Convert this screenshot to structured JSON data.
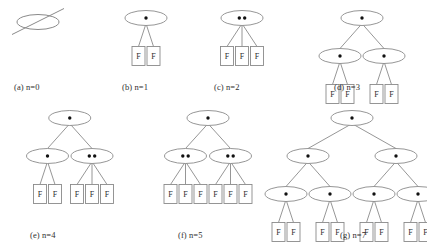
{
  "figure": {
    "background_color": "#ffffff",
    "stroke_color": "#8a8a8a",
    "dot_color": "#111111",
    "text_color": "#2c2c2c",
    "leaf_label": "F",
    "bottom_caption": "",
    "panels": [
      {
        "id": "panel-a",
        "caption": "(a) n=0",
        "x": 6,
        "y": 4,
        "width": 96,
        "height": 92,
        "caption_x": 14,
        "caption_y": 82,
        "empty_set": true,
        "root": null
      },
      {
        "id": "panel-b",
        "caption": "(b) n=1",
        "x": 104,
        "y": 4,
        "width": 84,
        "height": 92,
        "caption_x": 122,
        "caption_y": 82,
        "empty_set": false,
        "root": {
          "keys": 1,
          "children": [
            {
              "leaf": true,
              "label": "F"
            },
            {
              "leaf": true,
              "label": "F"
            }
          ]
        }
      },
      {
        "id": "panel-c",
        "caption": "(c) n=2",
        "x": 196,
        "y": 4,
        "width": 92,
        "height": 92,
        "caption_x": 214,
        "caption_y": 82,
        "empty_set": false,
        "root": {
          "keys": 2,
          "children": [
            {
              "leaf": true,
              "label": "F"
            },
            {
              "leaf": true,
              "label": "F"
            },
            {
              "leaf": true,
              "label": "F"
            }
          ]
        }
      },
      {
        "id": "panel-d",
        "caption": "(d) n=3",
        "x": 300,
        "y": 4,
        "width": 124,
        "height": 92,
        "caption_x": 334,
        "caption_y": 82,
        "empty_set": false,
        "root": {
          "keys": 1,
          "children": [
            {
              "keys": 1,
              "children": [
                {
                  "leaf": true,
                  "label": "F"
                },
                {
                  "leaf": true,
                  "label": "F"
                }
              ]
            },
            {
              "keys": 1,
              "children": [
                {
                  "leaf": true,
                  "label": "F"
                },
                {
                  "leaf": true,
                  "label": "F"
                }
              ]
            }
          ]
        }
      },
      {
        "id": "panel-e",
        "caption": "(e) n=4",
        "x": 8,
        "y": 104,
        "width": 124,
        "height": 118,
        "caption_x": 30,
        "caption_y": 230,
        "empty_set": false,
        "root": {
          "keys": 1,
          "children": [
            {
              "keys": 1,
              "children": [
                {
                  "leaf": true,
                  "label": "F"
                },
                {
                  "leaf": true,
                  "label": "F"
                }
              ]
            },
            {
              "keys": 2,
              "children": [
                {
                  "leaf": true,
                  "label": "F"
                },
                {
                  "leaf": true,
                  "label": "F"
                },
                {
                  "leaf": true,
                  "label": "F"
                }
              ]
            }
          ]
        }
      },
      {
        "id": "panel-f",
        "caption": "(f) n=5",
        "x": 146,
        "y": 104,
        "width": 124,
        "height": 118,
        "caption_x": 178,
        "caption_y": 230,
        "empty_set": false,
        "root": {
          "keys": 1,
          "children": [
            {
              "keys": 2,
              "children": [
                {
                  "leaf": true,
                  "label": "F"
                },
                {
                  "leaf": true,
                  "label": "F"
                },
                {
                  "leaf": true,
                  "label": "F"
                }
              ]
            },
            {
              "keys": 2,
              "children": [
                {
                  "leaf": true,
                  "label": "F"
                },
                {
                  "leaf": true,
                  "label": "F"
                },
                {
                  "leaf": true,
                  "label": "F"
                }
              ]
            }
          ]
        }
      },
      {
        "id": "panel-g",
        "caption": "(g) n=7",
        "x": 278,
        "y": 104,
        "width": 148,
        "height": 118,
        "caption_x": 340,
        "caption_y": 230,
        "empty_set": false,
        "root": {
          "keys": 1,
          "children": [
            {
              "keys": 1,
              "children": [
                {
                  "keys": 1,
                  "children": [
                    {
                      "leaf": true,
                      "label": "F"
                    },
                    {
                      "leaf": true,
                      "label": "F"
                    }
                  ]
                },
                {
                  "keys": 1,
                  "children": [
                    {
                      "leaf": true,
                      "label": "F"
                    },
                    {
                      "leaf": true,
                      "label": "F"
                    }
                  ]
                }
              ]
            },
            {
              "keys": 1,
              "children": [
                {
                  "keys": 1,
                  "children": [
                    {
                      "leaf": true,
                      "label": "F"
                    },
                    {
                      "leaf": true,
                      "label": "F"
                    }
                  ]
                },
                {
                  "keys": 1,
                  "children": [
                    {
                      "leaf": true,
                      "label": "F"
                    },
                    {
                      "leaf": true,
                      "label": "F"
                    }
                  ]
                }
              ]
            }
          ]
        }
      }
    ]
  }
}
